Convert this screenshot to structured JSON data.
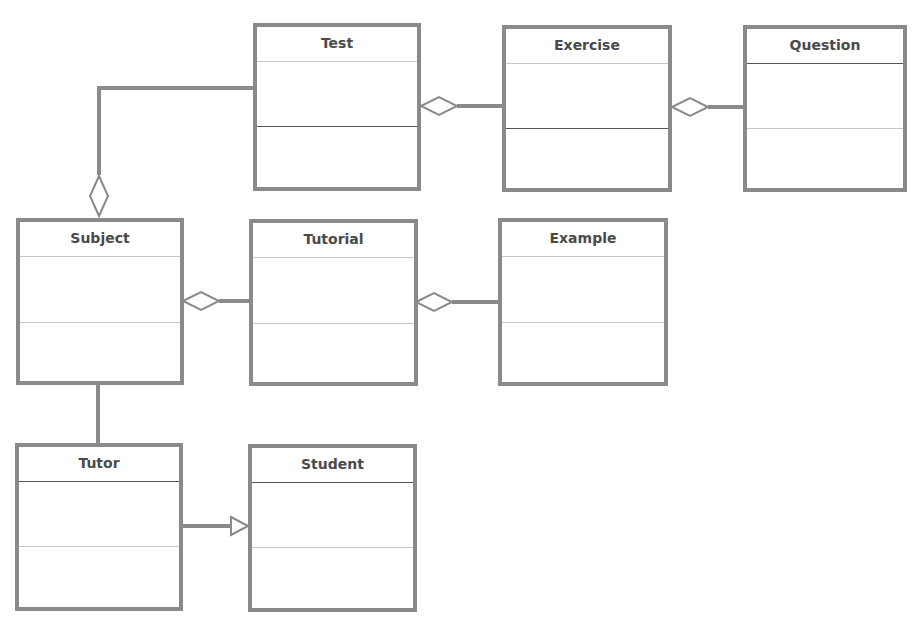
{
  "diagram": {
    "type": "uml-class-diagram",
    "colors": {
      "border": "#8a8a8a",
      "text": "#4a4a4a",
      "line": "#8a8a8a",
      "background": "#ffffff"
    },
    "classes": [
      {
        "id": "test",
        "name": "Test",
        "x": 253,
        "y": 23,
        "w": 168,
        "h": 168,
        "sep1": 34,
        "sep1_style": "light",
        "sep2": 99,
        "sep2_style": "solid"
      },
      {
        "id": "exercise",
        "name": "Exercise",
        "x": 502,
        "y": 25,
        "w": 170,
        "h": 167,
        "sep1": 34,
        "sep1_style": "light",
        "sep2": 99,
        "sep2_style": "solid"
      },
      {
        "id": "question",
        "name": "Question",
        "x": 743,
        "y": 25,
        "w": 164,
        "h": 167,
        "sep1": 34,
        "sep1_style": "solid",
        "sep2": 99,
        "sep2_style": "light"
      },
      {
        "id": "subject",
        "name": "Subject",
        "x": 16,
        "y": 218,
        "w": 168,
        "h": 167,
        "sep1": 34,
        "sep1_style": "light",
        "sep2": 100,
        "sep2_style": "light"
      },
      {
        "id": "tutorial",
        "name": "Tutorial",
        "x": 249,
        "y": 219,
        "w": 169,
        "h": 167,
        "sep1": 34,
        "sep1_style": "light",
        "sep2": 100,
        "sep2_style": "light"
      },
      {
        "id": "example",
        "name": "Example",
        "x": 498,
        "y": 218,
        "w": 170,
        "h": 168,
        "sep1": 34,
        "sep1_style": "light",
        "sep2": 100,
        "sep2_style": "light"
      },
      {
        "id": "tutor",
        "name": "Tutor",
        "x": 15,
        "y": 443,
        "w": 168,
        "h": 168,
        "sep1": 34,
        "sep1_style": "solid",
        "sep2": 99,
        "sep2_style": "light"
      },
      {
        "id": "student",
        "name": "Student",
        "x": 248,
        "y": 444,
        "w": 169,
        "h": 168,
        "sep1": 34,
        "sep1_style": "solid",
        "sep2": 99,
        "sep2_style": "light"
      }
    ],
    "relationships": [
      {
        "id": "test-subject",
        "kind": "aggregation",
        "whole": "Subject",
        "part": "Test",
        "points": [
          [
            253,
            88
          ],
          [
            99,
            88
          ],
          [
            99,
            175
          ]
        ],
        "diamond_tip": [
          99,
          216
        ],
        "diamond_axis": "vertical"
      },
      {
        "id": "test-exercise",
        "kind": "aggregation",
        "whole": "Test",
        "part": "Exercise",
        "points": [
          [
            502,
            106
          ],
          [
            457,
            106
          ]
        ],
        "diamond_tip": [
          421,
          106
        ],
        "diamond_axis": "horizontal"
      },
      {
        "id": "exercise-question",
        "kind": "aggregation",
        "whole": "Exercise",
        "part": "Question",
        "points": [
          [
            743,
            107
          ],
          [
            708,
            107
          ]
        ],
        "diamond_tip": [
          672,
          107
        ],
        "diamond_axis": "horizontal"
      },
      {
        "id": "subject-tutorial",
        "kind": "aggregation",
        "whole": "Subject",
        "part": "Tutorial",
        "points": [
          [
            249,
            301
          ],
          [
            219,
            301
          ]
        ],
        "diamond_tip": [
          183,
          301
        ],
        "diamond_axis": "horizontal"
      },
      {
        "id": "tutorial-example",
        "kind": "aggregation",
        "whole": "Tutorial",
        "part": "Example",
        "points": [
          [
            498,
            302
          ],
          [
            452,
            302
          ]
        ],
        "diamond_tip": [
          416,
          302
        ],
        "diamond_axis": "horizontal"
      },
      {
        "id": "subject-tutor",
        "kind": "association",
        "points": [
          [
            98,
            385
          ],
          [
            98,
            443
          ]
        ]
      },
      {
        "id": "tutor-student",
        "kind": "generalization",
        "child": "Tutor",
        "parent": "Student",
        "points": [
          [
            183,
            526
          ],
          [
            231,
            526
          ]
        ],
        "arrow_tip": [
          248,
          526
        ]
      }
    ]
  }
}
